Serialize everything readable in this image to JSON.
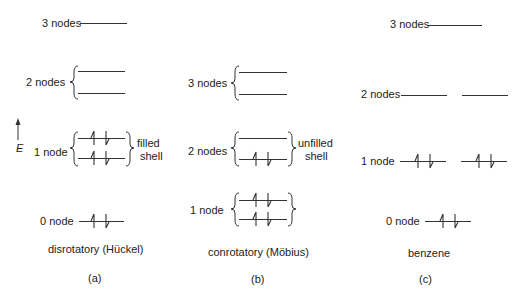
{
  "panels": [
    {
      "id": "a",
      "caption": "disrotatory (Hückel)",
      "sublabel": "(a)",
      "levels": [
        {
          "label": "3 nodes",
          "degeneracy": 1,
          "electrons": 0
        },
        {
          "label": "2 nodes",
          "degeneracy": 2,
          "electrons": 0
        },
        {
          "label": "1 node",
          "degeneracy": 2,
          "electrons": 4,
          "annotation": "filled shell"
        },
        {
          "label": "0 node",
          "degeneracy": 1,
          "electrons": 2
        }
      ]
    },
    {
      "id": "b",
      "caption": "conrotatory (Möbius)",
      "sublabel": "(b)",
      "levels": [
        {
          "label": "3 nodes",
          "degeneracy": 2,
          "electrons": 0
        },
        {
          "label": "2 nodes",
          "degeneracy": 2,
          "electrons": 2,
          "annotation": "unfilled shell"
        },
        {
          "label": "1 node",
          "degeneracy": 2,
          "electrons": 4
        }
      ]
    },
    {
      "id": "c",
      "caption": "benzene",
      "sublabel": "(c)",
      "levels": [
        {
          "label": "3 nodes",
          "degeneracy": 1,
          "electrons": 0
        },
        {
          "label": "2 nodes",
          "degeneracy": 2,
          "electrons": 0
        },
        {
          "label": "1 node",
          "degeneracy": 2,
          "electrons": 4
        },
        {
          "label": "0 node",
          "degeneracy": 1,
          "electrons": 2
        }
      ]
    }
  ],
  "axis": {
    "label": "E"
  },
  "text": {
    "a_3": "3 nodes",
    "a_2": "2 nodes",
    "a_1": "1 node",
    "a_0": "0 node",
    "a_filled": "filled",
    "a_shell": "shell",
    "a_caption": "disrotatory (Hückel)",
    "a_sub": "(a)",
    "b_3": "3 nodes",
    "b_2": "2 nodes",
    "b_1": "1 node",
    "b_unfilled": "unfilled",
    "b_shell": "shell",
    "b_caption": "conrotatory (Möbius)",
    "b_sub": "(b)",
    "c_3": "3 nodes",
    "c_2": "2 nodes",
    "c_1": "1 node",
    "c_0": "0 node",
    "c_caption": "benzene",
    "c_sub": "(c)",
    "e": "E"
  }
}
